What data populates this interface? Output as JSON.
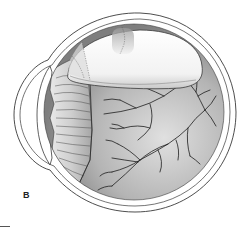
{
  "figure": {
    "panel_label": "B",
    "colors": {
      "outline": "#3a3a3a",
      "sclera": "#ffffff",
      "fundus_dark": "#8c8c8c",
      "fundus_light": "#d4d4d4",
      "detached_retina": "#f4f4f4",
      "vessel": "#1e1e1e",
      "ciliary": "#b8b8b8"
    }
  }
}
